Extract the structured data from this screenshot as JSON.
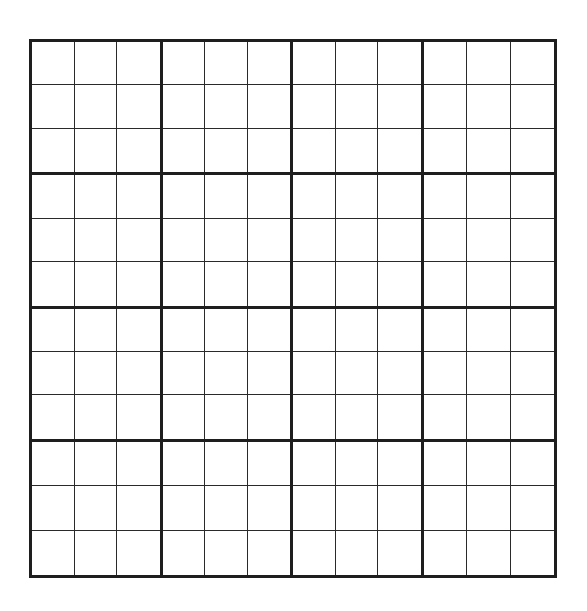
{
  "puzzle": {
    "type": "sudoku-grid",
    "size": 12,
    "block_cols": 4,
    "block_rows": 4,
    "block_width_cells": 3,
    "block_height_cells": 3,
    "line_color": "#1e1e1e",
    "background": "#ffffff",
    "cells": [
      [
        "",
        "",
        "",
        "",
        "",
        "",
        "",
        "",
        "",
        "",
        "",
        ""
      ],
      [
        "",
        "",
        "",
        "",
        "",
        "",
        "",
        "",
        "",
        "",
        "",
        ""
      ],
      [
        "",
        "",
        "",
        "",
        "",
        "",
        "",
        "",
        "",
        "",
        "",
        ""
      ],
      [
        "",
        "",
        "",
        "",
        "",
        "",
        "",
        "",
        "",
        "",
        "",
        ""
      ],
      [
        "",
        "",
        "",
        "",
        "",
        "",
        "",
        "",
        "",
        "",
        "",
        ""
      ],
      [
        "",
        "",
        "",
        "",
        "",
        "",
        "",
        "",
        "",
        "",
        "",
        ""
      ],
      [
        "",
        "",
        "",
        "",
        "",
        "",
        "",
        "",
        "",
        "",
        "",
        ""
      ],
      [
        "",
        "",
        "",
        "",
        "",
        "",
        "",
        "",
        "",
        "",
        "",
        ""
      ],
      [
        "",
        "",
        "",
        "",
        "",
        "",
        "",
        "",
        "",
        "",
        "",
        ""
      ],
      [
        "",
        "",
        "",
        "",
        "",
        "",
        "",
        "",
        "",
        "",
        "",
        ""
      ],
      [
        "",
        "",
        "",
        "",
        "",
        "",
        "",
        "",
        "",
        "",
        "",
        ""
      ],
      [
        "",
        "",
        "",
        "",
        "",
        "",
        "",
        "",
        "",
        "",
        "",
        ""
      ]
    ]
  }
}
